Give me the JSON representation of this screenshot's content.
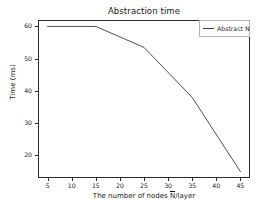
{
  "chart_data": {
    "type": "line",
    "title": "Abstraction time",
    "xlabel": "The number of nodes N̄/layer",
    "ylabel": "Time (ms)",
    "xlim": [
      3,
      47
    ],
    "ylim": [
      13,
      62
    ],
    "grid": false,
    "legend_position": "upper right",
    "xticks": [
      5,
      10,
      15,
      20,
      25,
      30,
      35,
      40,
      45
    ],
    "xticklabels": [
      "5",
      "10",
      "15",
      "20",
      "25",
      "30",
      "35",
      "40",
      "45"
    ],
    "yticks": [
      20,
      30,
      40,
      50,
      60
    ],
    "yticklabels": [
      "20",
      "30",
      "40",
      "50",
      "60"
    ],
    "series": [
      {
        "name": "Abstract N̄",
        "color": "#3a3a3a",
        "x": [
          5,
          15,
          25,
          35,
          45
        ],
        "values": [
          60,
          60,
          53.5,
          38,
          15
        ]
      }
    ]
  },
  "legend": {
    "entries": [
      {
        "label": "Abstract N̄",
        "label_main": "Abstract N"
      }
    ]
  },
  "axis_label_parts": {
    "xlabel_pre": "The number of nodes ",
    "xlabel_bar": "N",
    "xlabel_post": "/layer"
  }
}
